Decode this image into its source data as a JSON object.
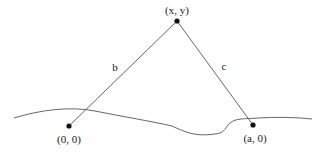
{
  "diagram": {
    "title": "",
    "points": [
      {
        "id": "apex",
        "label": "(x, y)"
      },
      {
        "id": "origin",
        "label": "(0, 0)"
      },
      {
        "id": "right",
        "label": "(a, 0)"
      }
    ],
    "edges": [
      {
        "from": "origin",
        "to": "apex",
        "label": "b"
      },
      {
        "from": "right",
        "to": "apex",
        "label": "c"
      }
    ],
    "terrain": {
      "description": "wavy ground line"
    }
  }
}
